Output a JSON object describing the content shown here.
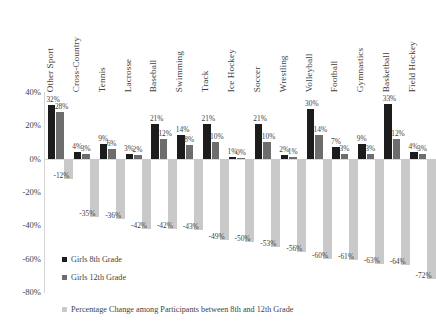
{
  "chart_data": {
    "type": "bar",
    "title": "",
    "xlabel": "",
    "ylabel": "",
    "ylim": [
      -80,
      40
    ],
    "grid": false,
    "legend_position": "bottom-left",
    "ytick_labels": [
      "40%",
      "20%",
      "0%",
      "-20%",
      "-40%",
      "-60%",
      "-80%"
    ],
    "ytick_values": [
      40,
      20,
      0,
      -20,
      -40,
      -60,
      -80
    ],
    "categories": [
      "Other Sport",
      "Cross-Country",
      "Tennis",
      "Lacrosse",
      "Baseball",
      "Swimming",
      "Track",
      "Ice Hockey",
      "Soccer",
      "Wrestling",
      "Volleyball",
      "Football",
      "Gymnastics",
      "Basketball",
      "Field Hockey"
    ],
    "series": [
      {
        "name": "Girls 8th Grade",
        "color": "#1c1c1c",
        "values": [
          32,
          4,
          9,
          3,
          21,
          14,
          21,
          1,
          21,
          2,
          30,
          7,
          9,
          33,
          4
        ],
        "labels": [
          "32%",
          "4%",
          "9%",
          "3%",
          "21%",
          "14%",
          "21%",
          "1%",
          "21%",
          "2%",
          "30%",
          "7%",
          "9%",
          "33%",
          "4%"
        ]
      },
      {
        "name": "Girls 12th Grade",
        "color": "#6d6d6d",
        "values": [
          28,
          3,
          6,
          2,
          12,
          8,
          10,
          0,
          10,
          1,
          14,
          3,
          3,
          12,
          3
        ],
        "labels": [
          "28%",
          "3%",
          "6%",
          "2%",
          "12%",
          "8%",
          "10%",
          "0%",
          "10%",
          "1%",
          "14%",
          "3%",
          "3%",
          "12%",
          "3%"
        ]
      },
      {
        "name": "Percentage Change among Participants between 8th and 12th Grade",
        "color": "#c9c9c9",
        "values": [
          -12,
          -35,
          -36,
          -42,
          -42,
          -43,
          -49,
          -50,
          -53,
          -56,
          -60,
          -61,
          -63,
          -64,
          -72
        ],
        "labels": [
          "-12%",
          "-35%",
          "-36%",
          "-42%",
          "-42%",
          "-43%",
          "-49%",
          "-50%",
          "-53%",
          "-56%",
          "-60%",
          "-61%",
          "-63%",
          "-64%",
          "-72%"
        ]
      }
    ]
  },
  "legend": {
    "items": [
      {
        "label": "Girls 8th Grade",
        "color": "#1c1c1c"
      },
      {
        "label": "Girls 12th Grade",
        "color": "#6d6d6d"
      }
    ]
  },
  "caption": {
    "label": "Percentage Change among Participants between 8th and 12th Grade",
    "color": "#c9c9c9"
  }
}
